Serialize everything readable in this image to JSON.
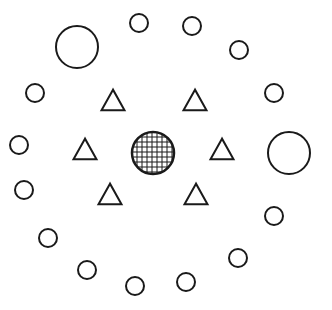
{
  "diagram": {
    "width": 332,
    "height": 310,
    "stroke_color": "#1a1a1a",
    "background": "#ffffff",
    "stroke_width": 2,
    "center_shape": {
      "type": "hatched-circle",
      "cx": 153,
      "cy": 153,
      "r": 21,
      "grid_spacing": 5
    },
    "triangles": [
      {
        "cx": 113,
        "cy": 100,
        "size": 23
      },
      {
        "cx": 195,
        "cy": 100,
        "size": 23
      },
      {
        "cx": 85,
        "cy": 149,
        "size": 23
      },
      {
        "cx": 222,
        "cy": 149,
        "size": 23
      },
      {
        "cx": 110,
        "cy": 194,
        "size": 23
      },
      {
        "cx": 196,
        "cy": 194,
        "size": 23
      }
    ],
    "circles": [
      {
        "cx": 77,
        "cy": 47,
        "r": 21
      },
      {
        "cx": 139,
        "cy": 23,
        "r": 9
      },
      {
        "cx": 192,
        "cy": 26,
        "r": 9
      },
      {
        "cx": 239,
        "cy": 50,
        "r": 9
      },
      {
        "cx": 274,
        "cy": 93,
        "r": 9
      },
      {
        "cx": 289,
        "cy": 153,
        "r": 21
      },
      {
        "cx": 274,
        "cy": 216,
        "r": 9
      },
      {
        "cx": 238,
        "cy": 258,
        "r": 9
      },
      {
        "cx": 186,
        "cy": 282,
        "r": 9
      },
      {
        "cx": 135,
        "cy": 286,
        "r": 9
      },
      {
        "cx": 87,
        "cy": 270,
        "r": 9
      },
      {
        "cx": 48,
        "cy": 238,
        "r": 9
      },
      {
        "cx": 24,
        "cy": 190,
        "r": 9
      },
      {
        "cx": 19,
        "cy": 145,
        "r": 9
      },
      {
        "cx": 35,
        "cy": 93,
        "r": 9
      }
    ]
  }
}
